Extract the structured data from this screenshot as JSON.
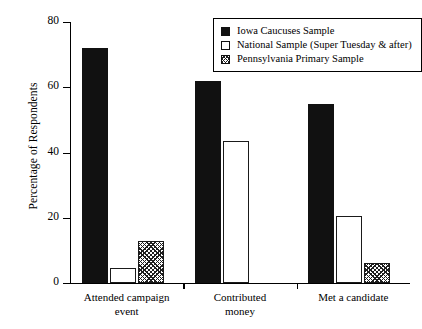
{
  "chart_data": {
    "type": "bar",
    "title": "",
    "xlabel": "",
    "ylabel": "Percentage of Respondents",
    "ylim": [
      0,
      80
    ],
    "yticks": [
      0,
      20,
      40,
      60,
      80
    ],
    "ytick_labels": [
      "0",
      "20",
      "40",
      "60",
      "80"
    ],
    "grid": false,
    "legend_position": "top-right",
    "categories": [
      "Attended campaign event",
      "Contributed money",
      "Met a candidate"
    ],
    "category_lines": [
      [
        "Attended campaign",
        "event"
      ],
      [
        "Contributed",
        "money"
      ],
      [
        "Met a candidate",
        ""
      ]
    ],
    "series": [
      {
        "name": "Iowa Caucuses Sample",
        "pattern": "solid",
        "color": "#111111",
        "values": [
          72,
          62,
          55
        ]
      },
      {
        "name": "National Sample (Super Tuesday & after)",
        "pattern": "open",
        "color": "#ffffff",
        "values": [
          4.5,
          43.5,
          20.5
        ]
      },
      {
        "name": "Pennsylvania Primary Sample",
        "pattern": "hatch",
        "color": "#1f1f1f",
        "values": [
          13,
          null,
          6
        ]
      }
    ]
  },
  "legend": {
    "items": [
      {
        "label": "Iowa Caucuses Sample",
        "pattern": "solid"
      },
      {
        "label": "National Sample (Super Tuesday & after)",
        "pattern": "open"
      },
      {
        "label": "Pennsylvania Primary Sample",
        "pattern": "hatch"
      }
    ]
  }
}
